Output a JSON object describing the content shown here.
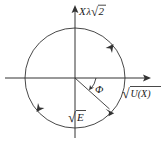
{
  "figure": {
    "type": "phase-space-diagram",
    "background_color": "#ffffff",
    "stroke_color": "#333333",
    "text_color": "#1a1a1a"
  },
  "axes": {
    "vertical": {
      "label_parts": {
        "variable": "X",
        "lambda": "λ",
        "radical": "√",
        "radicand": "2"
      },
      "label_text": "Xλ√2",
      "arrow": "up"
    },
    "horizontal": {
      "label_parts": {
        "radical": "√",
        "radicand": "U(X)"
      },
      "label_text": "√U(X)",
      "arrow": "right"
    }
  },
  "circle": {
    "center_x": 75,
    "center_y": 78,
    "radius": 50,
    "direction": "counterclockwise",
    "arrowheads": [
      {
        "name": "upper-right-arrow",
        "angle_deg": 42
      },
      {
        "name": "lower-left-arrow",
        "angle_deg": 222
      }
    ]
  },
  "vector": {
    "label_parts": {
      "radical": "√",
      "radicand": "E"
    },
    "label_text": "√E",
    "angle_deg": -42,
    "from": "origin",
    "to": "circle-edge"
  },
  "angle": {
    "symbol": "Φ",
    "name": "phi",
    "between": "positive-horizontal-axis-and-vector"
  }
}
